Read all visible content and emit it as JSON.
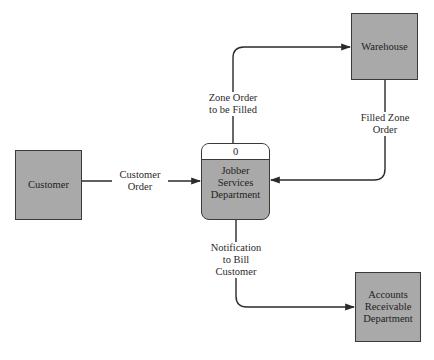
{
  "diagram": {
    "type": "data-flow-diagram",
    "colors": {
      "entity_fill": "#a9a9a9",
      "line": "#2a2a2a",
      "background": "#ffffff"
    },
    "entities": [
      {
        "id": "customer",
        "label": "Customer"
      },
      {
        "id": "warehouse",
        "label": "Warehouse"
      },
      {
        "id": "accounts",
        "label": "Accounts\nReceivable\nDepartment"
      }
    ],
    "process": {
      "number": "0",
      "label": "Jobber\nServices\nDepartment"
    },
    "flows": [
      {
        "id": "customer-order",
        "label": "Customer\nOrder",
        "from": "Customer",
        "to": "Jobber Services Department"
      },
      {
        "id": "zone-order",
        "label": "Zone Order\nto be Filled",
        "from": "Jobber Services Department",
        "to": "Warehouse"
      },
      {
        "id": "filled-zone-order",
        "label": "Filled Zone\nOrder",
        "from": "Warehouse",
        "to": "Jobber Services Department"
      },
      {
        "id": "notification",
        "label": "Notification\nto Bill\nCustomer",
        "from": "Jobber Services Department",
        "to": "Accounts Receivable Department"
      }
    ]
  }
}
